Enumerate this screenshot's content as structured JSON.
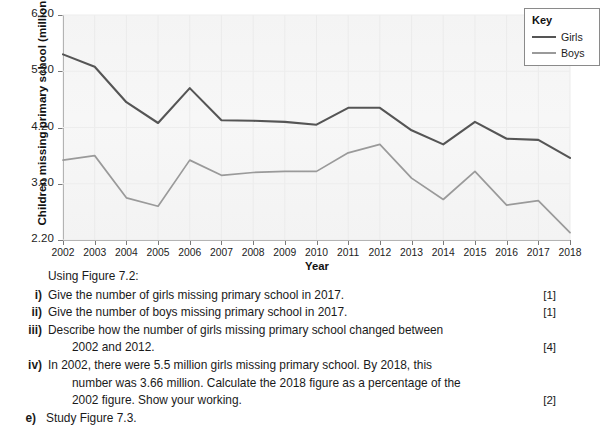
{
  "chart_data": {
    "type": "line",
    "title": "",
    "xlabel": "Year",
    "ylabel": "Children missing primary school (millions)",
    "ylim": [
      2.2,
      6.2
    ],
    "y_ticks": [
      "6.20",
      "5.20",
      "4.20",
      "3.20",
      "2.20"
    ],
    "y_tick_values": [
      6.2,
      5.2,
      4.2,
      3.2,
      2.2
    ],
    "grid": false,
    "legend_position": "top-right",
    "legend_title": "Key",
    "categories": [
      "2002",
      "2003",
      "2004",
      "2005",
      "2006",
      "2007",
      "2008",
      "2009",
      "2010",
      "2011",
      "2012",
      "2013",
      "2014",
      "2015",
      "2016",
      "2017",
      "2018"
    ],
    "series": [
      {
        "name": "Girls",
        "color": "#555555",
        "values": [
          5.5,
          5.28,
          4.65,
          4.28,
          4.9,
          4.33,
          4.32,
          4.3,
          4.25,
          4.55,
          4.55,
          4.15,
          3.9,
          4.3,
          4.0,
          3.98,
          3.66
        ]
      },
      {
        "name": "Boys",
        "color": "#9a9a9a",
        "values": [
          3.62,
          3.7,
          2.95,
          2.8,
          3.62,
          3.35,
          3.4,
          3.42,
          3.42,
          3.75,
          3.9,
          3.3,
          2.92,
          3.42,
          2.82,
          2.9,
          2.33
        ]
      }
    ]
  },
  "legend": {
    "title": "Key",
    "items": [
      {
        "label": "Girls"
      },
      {
        "label": "Boys"
      }
    ]
  },
  "axes": {
    "y_title": "Children missing primary school (millions)",
    "x_title": "Year"
  },
  "questions": {
    "intro": "Using Figure 7.2:",
    "items": [
      {
        "marker": "i)",
        "text": "Give the number of girls missing primary school in 2017.",
        "marks": "[1]",
        "continuation": ""
      },
      {
        "marker": "ii)",
        "text": "Give the number of boys missing primary school in 2017.",
        "marks": "[1]",
        "continuation": ""
      },
      {
        "marker": "iii)",
        "text": "Describe how the number of girls missing primary school changed between",
        "marks": "[4]",
        "continuation": "2002 and 2012."
      },
      {
        "marker": "iv)",
        "text": "In 2002, there were 5.5 million girls missing primary school. By 2018, this",
        "marks": "[2]",
        "continuation": "number was 3.66 million. Calculate the 2018 figure as a percentage of the",
        "continuation2": "2002 figure. Show your working."
      }
    ],
    "next_part": {
      "marker": "e)",
      "text": "Study Figure 7.3."
    }
  }
}
